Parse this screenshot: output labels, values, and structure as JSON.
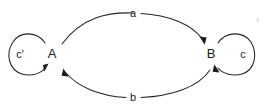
{
  "diagram": {
    "type": "state-transition-diagram",
    "background_color": "#ffffff",
    "stroke_color": "#242424",
    "nodes": [
      {
        "id": "A",
        "label": "A",
        "x": 52,
        "y": 55
      },
      {
        "id": "B",
        "label": "B",
        "x": 211,
        "y": 55
      }
    ],
    "edges": [
      {
        "id": "a",
        "label": "a",
        "from": "A",
        "to": "B",
        "position": "top",
        "label_x": 133,
        "label_y": 14
      },
      {
        "id": "b",
        "label": "b",
        "from": "B",
        "to": "A",
        "position": "bottom",
        "label_x": 133,
        "label_y": 97
      }
    ],
    "self_loops": [
      {
        "id": "c-prime",
        "label": "c'",
        "node": "A",
        "side": "left",
        "label_x": 20,
        "label_y": 55
      },
      {
        "id": "c",
        "label": "c",
        "node": "B",
        "side": "right",
        "label_x": 243,
        "label_y": 55
      }
    ]
  }
}
